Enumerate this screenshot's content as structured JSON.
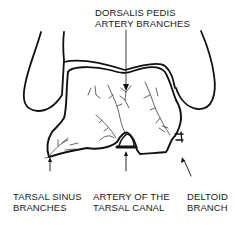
{
  "diagram": {
    "type": "anatomical-line-drawing",
    "colors": {
      "line": "#111111",
      "text": "#1a1a1a",
      "background": "#ffffff"
    },
    "labels": {
      "dorsalis_pedis": {
        "line1": "DORSALIS PEDIS",
        "line2": "ARTERY BRANCHES"
      },
      "tarsal_sinus": {
        "line1": "TARSAL SINUS",
        "line2": "BRANCHES"
      },
      "tarsal_canal": {
        "line1": "ARTERY OF THE",
        "line2": "TARSAL CANAL"
      },
      "deltoid": {
        "line1": "DELTOID",
        "line2": "BRANCH"
      }
    }
  }
}
